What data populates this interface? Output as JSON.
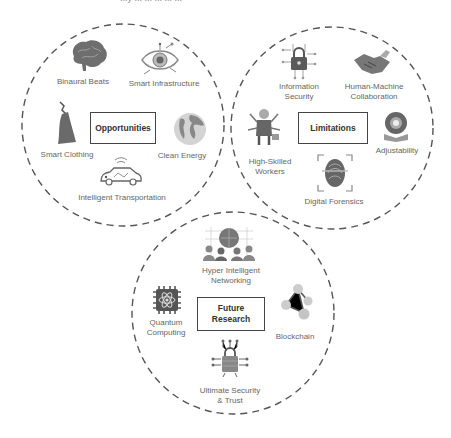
{
  "header": {
    "clipped_text": "...y ... ... ... ... ..."
  },
  "colors": {
    "stroke": "#555555",
    "icon_gray": "#8a8a8a",
    "icon_dark": "#555555",
    "box_border": "#444444"
  },
  "groups": [
    {
      "title": "Opportunities",
      "items": [
        {
          "label": "Binaural Beats",
          "icon": "brain-icon"
        },
        {
          "label": "Smart Infrastructure",
          "icon": "eye-circuit-icon"
        },
        {
          "label": "Smart Clothing",
          "icon": "dress-icon"
        },
        {
          "label": "Clean Energy",
          "icon": "globe-icon"
        },
        {
          "label": "Intelligent Transportation",
          "icon": "connected-car-icon"
        }
      ]
    },
    {
      "title": "Limitations",
      "items": [
        {
          "label": "Information Security",
          "line1": "Information",
          "line2": "Security",
          "icon": "padlock-circuit-icon"
        },
        {
          "label": "Human-Machine Collaboration",
          "line1": "Human-Machine",
          "line2": "Collaboration",
          "icon": "handshake-icon"
        },
        {
          "label": "High-Skilled Workers",
          "line1": "High-Skilled",
          "line2": "Workers",
          "icon": "multitask-worker-icon"
        },
        {
          "label": "Adjustability",
          "icon": "gear-book-icon"
        },
        {
          "label": "Digital Forensics",
          "icon": "fingerprint-scan-icon"
        }
      ]
    },
    {
      "title": "Future Research",
      "title_line1": "Future",
      "title_line2": "Research",
      "items": [
        {
          "label": "Hyper Intelligent Networking",
          "line1": "Hyper Intelligent",
          "line2": "Networking",
          "icon": "network-globe-people-icon"
        },
        {
          "label": "Quantum Computing",
          "line1": "Quantum",
          "line2": "Computing",
          "icon": "atom-chip-icon"
        },
        {
          "label": "Blockchain",
          "icon": "blockchain-nodes-icon"
        },
        {
          "label": "Ultimate Security & Trust",
          "line1": "Ultimate Security",
          "line2": "& Trust",
          "icon": "lock-circuit-icon"
        }
      ]
    }
  ]
}
